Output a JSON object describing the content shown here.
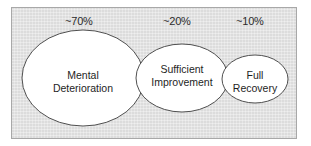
{
  "figure": {
    "type": "euler-flow-diagram",
    "background_color": "#ffffff",
    "panel_color": "#dcdcdc",
    "panel_border_color": "#a8a8a8",
    "ellipse_fill": "#ffffff",
    "ellipse_stroke": "#3c3c3c",
    "text_color": "#1e1e1e"
  },
  "percent_labels": [
    {
      "text": "~70%",
      "for": "mental-deterioration"
    },
    {
      "text": "~20%",
      "for": "sufficient-improvement"
    },
    {
      "text": "~10%",
      "for": "full-recovery"
    }
  ],
  "ellipses": [
    {
      "id": "mental-deterioration",
      "line1": "Mental",
      "line2": "Deterioration",
      "percent": "~70%",
      "cx": 83,
      "cy": 78,
      "rx": 61,
      "ry": 48
    },
    {
      "id": "sufficient-improvement",
      "line1": "Sufficient",
      "line2": "Improvement",
      "percent": "~20%",
      "cx": 182,
      "cy": 78,
      "rx": 46,
      "ry": 34
    },
    {
      "id": "full-recovery",
      "line1": "Full",
      "line2": "Recovery",
      "percent": "~10%",
      "cx": 255,
      "cy": 79,
      "rx": 33,
      "ry": 24
    }
  ]
}
